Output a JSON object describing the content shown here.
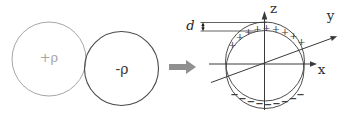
{
  "scene": {
    "left_diagram": {
      "positive_sphere": {
        "label": "+ρ",
        "color": "#a6a6a6"
      },
      "negative_sphere": {
        "label": "-ρ",
        "color": "#4a4a4a"
      },
      "negative_label_color": "#3c3c3c"
    },
    "transform_arrow": {
      "color": "#909090"
    },
    "right_diagram": {
      "axes": {
        "x_label": "x",
        "y_label": "y",
        "z_label": "z"
      },
      "offset": {
        "label": "d"
      },
      "line_color": "#3a3a3a",
      "plus_glyph": "+",
      "minus_glyph": "−",
      "plus_signs": [
        [
          232.5,
          44.5
        ],
        [
          240,
          36.5
        ],
        [
          248.5,
          31.5
        ],
        [
          257.5,
          28
        ],
        [
          266.5,
          27
        ],
        [
          276,
          28
        ],
        [
          285,
          31
        ],
        [
          293.5,
          35.5
        ],
        [
          301.5,
          41.5
        ]
      ],
      "minus_signs": [
        [
          234.5,
          94.5
        ],
        [
          242.5,
          98.5
        ],
        [
          251,
          101.5
        ],
        [
          259.5,
          103.5
        ],
        [
          268,
          104
        ],
        [
          276.5,
          103.3
        ],
        [
          285,
          101.5
        ],
        [
          293,
          98.5
        ],
        [
          300.5,
          94.5
        ]
      ]
    }
  }
}
